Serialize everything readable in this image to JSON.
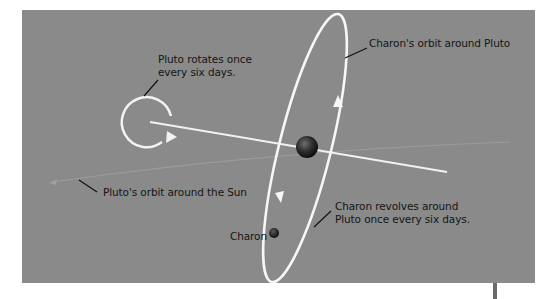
{
  "diagram": {
    "background": "#8a8a8a",
    "line_color": "#f2f2f2",
    "labels": {
      "pluto_rotation_line1": "Pluto rotates once",
      "pluto_rotation_line2": "every six days.",
      "charon_orbit": "Charon's orbit around Pluto",
      "pluto_sun_orbit": "Pluto's orbit around the Sun",
      "charon_revolves_line1": "Charon revolves around",
      "charon_revolves_line2": "Pluto once every six days.",
      "charon": "Charon"
    },
    "bodies": [
      {
        "name": "Pluto",
        "position": "center of Charon's orbit"
      },
      {
        "name": "Charon",
        "position": "lower-left of Charon's orbit"
      }
    ]
  }
}
